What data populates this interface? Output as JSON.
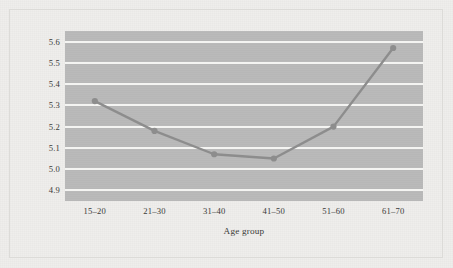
{
  "figure": {
    "background_color": "#efeeec",
    "frame_color": "#dcdbd8",
    "plot_background_color": "#b9b9b9",
    "gridline_color": "#f4f4f2",
    "series_color": "#8d8d8d",
    "text_color": "#3a3a38"
  },
  "chart_data": {
    "type": "line",
    "title": "",
    "xlabel": "Age group",
    "ylabel": "Average life satisfaction score",
    "categories": [
      "15–20",
      "21–30",
      "31–40",
      "41–50",
      "51–60",
      "61–70"
    ],
    "values": [
      5.32,
      5.18,
      5.07,
      5.05,
      5.2,
      5.57
    ],
    "series": [
      {
        "name": "Average life satisfaction score",
        "values": [
          5.32,
          5.18,
          5.07,
          5.05,
          5.2,
          5.57
        ]
      }
    ],
    "ylim": [
      4.85,
      5.65
    ],
    "yticks": [
      4.9,
      5.0,
      5.1,
      5.2,
      5.3,
      5.4,
      5.5,
      5.6
    ],
    "ytick_labels": [
      "4.9",
      "5.0",
      "5.1",
      "5.2",
      "5.3",
      "5.4",
      "5.5",
      "5.6"
    ],
    "grid": true,
    "grid_axis": "y",
    "legend": false,
    "legend_position": "none",
    "marker": "circle",
    "line_color": "#8d8d8d",
    "marker_color": "#8d8d8d"
  }
}
